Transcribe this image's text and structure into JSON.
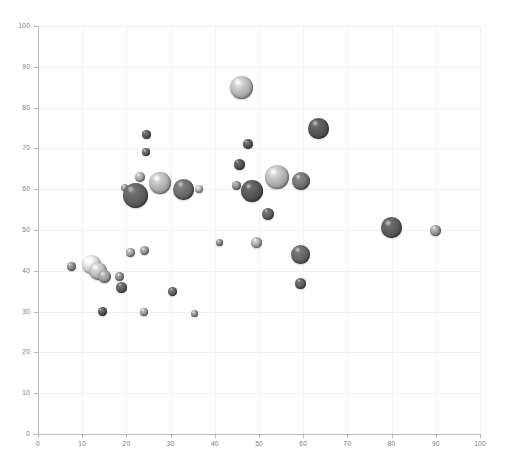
{
  "chart_data": {
    "type": "scatter",
    "title": "",
    "subtitle": "",
    "xlabel": "",
    "ylabel": "",
    "xlim": [
      0,
      100
    ],
    "ylim": [
      0,
      100
    ],
    "xticks": [
      0,
      10,
      20,
      30,
      40,
      50,
      60,
      70,
      80,
      90,
      100
    ],
    "yticks": [
      0,
      10,
      20,
      30,
      40,
      50,
      60,
      70,
      80,
      90,
      100
    ],
    "grid": true,
    "legend": false,
    "marker_style": "3d-shaded-sphere",
    "note": "Bubble chart: each point has x, y and a size (bubble radius in px) plus a grayscale shade.",
    "points": [
      {
        "x": 7.5,
        "y": 41.0,
        "r": 4.5,
        "color": "#8a8a8a"
      },
      {
        "x": 12.0,
        "y": 41.5,
        "r": 9.5,
        "color": "#d2d2d2"
      },
      {
        "x": 13.5,
        "y": 40.0,
        "r": 9.0,
        "color": "#b8b8b8"
      },
      {
        "x": 15.0,
        "y": 38.5,
        "r": 6.5,
        "color": "#9c9c9c"
      },
      {
        "x": 18.5,
        "y": 38.5,
        "r": 4.5,
        "color": "#8d8d8d"
      },
      {
        "x": 19.0,
        "y": 36.0,
        "r": 5.5,
        "color": "#606060"
      },
      {
        "x": 14.5,
        "y": 30.0,
        "r": 4.5,
        "color": "#5a5a5a"
      },
      {
        "x": 21.0,
        "y": 44.5,
        "r": 4.5,
        "color": "#a0a0a0"
      },
      {
        "x": 24.0,
        "y": 45.0,
        "r": 4.5,
        "color": "#9a9a9a"
      },
      {
        "x": 24.0,
        "y": 30.0,
        "r": 4.0,
        "color": "#9e9e9e"
      },
      {
        "x": 30.5,
        "y": 35.0,
        "r": 4.5,
        "color": "#666666"
      },
      {
        "x": 35.5,
        "y": 29.5,
        "r": 3.5,
        "color": "#999999"
      },
      {
        "x": 24.5,
        "y": 73.5,
        "r": 4.5,
        "color": "#5c5c5c"
      },
      {
        "x": 24.5,
        "y": 69.0,
        "r": 4.0,
        "color": "#656565"
      },
      {
        "x": 19.5,
        "y": 60.5,
        "r": 3.5,
        "color": "#9b9b9b"
      },
      {
        "x": 22.0,
        "y": 58.5,
        "r": 12.5,
        "color": "#5e5e5e"
      },
      {
        "x": 23.0,
        "y": 63.0,
        "r": 5.0,
        "color": "#a5a5a5"
      },
      {
        "x": 27.5,
        "y": 61.5,
        "r": 11.0,
        "color": "#b0b0b0"
      },
      {
        "x": 33.0,
        "y": 60.0,
        "r": 10.5,
        "color": "#6a6a6a"
      },
      {
        "x": 36.5,
        "y": 60.0,
        "r": 4.0,
        "color": "#b4b4b4"
      },
      {
        "x": 41.0,
        "y": 47.0,
        "r": 3.5,
        "color": "#8e8e8e"
      },
      {
        "x": 46.0,
        "y": 85.0,
        "r": 11.5,
        "color": "#b5b5b5"
      },
      {
        "x": 47.5,
        "y": 71.0,
        "r": 5.0,
        "color": "#5a5a5a"
      },
      {
        "x": 45.5,
        "y": 66.0,
        "r": 5.5,
        "color": "#555555"
      },
      {
        "x": 45.0,
        "y": 61.0,
        "r": 4.5,
        "color": "#8d8d8d"
      },
      {
        "x": 48.5,
        "y": 59.5,
        "r": 11.0,
        "color": "#565656"
      },
      {
        "x": 54.0,
        "y": 63.0,
        "r": 12.0,
        "color": "#b2b2b2"
      },
      {
        "x": 59.5,
        "y": 62.0,
        "r": 9.0,
        "color": "#707070"
      },
      {
        "x": 52.0,
        "y": 54.0,
        "r": 6.0,
        "color": "#606060"
      },
      {
        "x": 49.5,
        "y": 47.0,
        "r": 5.5,
        "color": "#a8a8a8"
      },
      {
        "x": 59.5,
        "y": 44.0,
        "r": 9.5,
        "color": "#646464"
      },
      {
        "x": 59.5,
        "y": 37.0,
        "r": 5.5,
        "color": "#5e5e5e"
      },
      {
        "x": 63.5,
        "y": 75.0,
        "r": 10.5,
        "color": "#565656"
      },
      {
        "x": 80.0,
        "y": 50.5,
        "r": 10.5,
        "color": "#5b5b5b"
      },
      {
        "x": 90.0,
        "y": 50.0,
        "r": 5.5,
        "color": "#9a9a9a"
      }
    ]
  },
  "caption": "",
  "axis": {
    "x_tick_labels": [
      "0",
      "10",
      "20",
      "30",
      "40",
      "50",
      "60",
      "70",
      "80",
      "90",
      "100"
    ],
    "y_tick_labels": [
      "0",
      "10",
      "20",
      "30",
      "40",
      "50",
      "60",
      "70",
      "80",
      "90",
      "100"
    ]
  },
  "colors": {
    "background": "#ffffff",
    "gridline": "#f0f0f0",
    "axis": "#b9b9b9",
    "tick_text": "#7a7a7a"
  }
}
